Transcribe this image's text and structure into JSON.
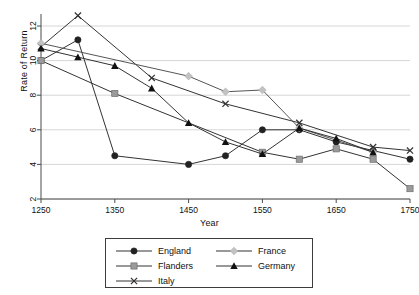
{
  "chart_data": {
    "type": "line",
    "title": "",
    "xlabel": "Year",
    "ylabel": "Rate of Return",
    "xlim": [
      1250,
      1750
    ],
    "ylim": [
      2,
      13
    ],
    "xticks": [
      1250,
      1350,
      1450,
      1550,
      1650,
      1750
    ],
    "yticks": [
      2,
      4,
      6,
      8,
      10,
      12
    ],
    "grid": "horizontal",
    "legend_position": "below-center",
    "series": [
      {
        "name": "England",
        "marker": "filled-circle",
        "color": "#222222",
        "x": [
          1250,
          1300,
          1350,
          1450,
          1500,
          1550,
          1600,
          1650,
          1700,
          1750
        ],
        "y": [
          10.0,
          11.2,
          4.5,
          4.0,
          4.5,
          6.0,
          6.0,
          5.3,
          4.8,
          4.3
        ]
      },
      {
        "name": "Flanders",
        "marker": "filled-square",
        "color": "#9a9a9a",
        "x": [
          1250,
          1350,
          1550,
          1600,
          1650,
          1700,
          1750
        ],
        "y": [
          10.0,
          8.1,
          4.7,
          4.3,
          4.9,
          4.3,
          2.6
        ]
      },
      {
        "name": "Italy",
        "marker": "cross",
        "color": "#333333",
        "x": [
          1250,
          1300,
          1400,
          1500,
          1600,
          1700,
          1750
        ],
        "y": [
          10.8,
          12.6,
          9.0,
          7.5,
          6.4,
          5.0,
          4.8
        ]
      },
      {
        "name": "France",
        "marker": "filled-diamond",
        "color": "#c2c2c2",
        "x": [
          1250,
          1450,
          1500,
          1550,
          1600,
          1700
        ],
        "y": [
          11.0,
          9.1,
          8.2,
          8.3,
          6.1,
          4.7
        ]
      },
      {
        "name": "Germany",
        "marker": "filled-triangle",
        "color": "#111111",
        "x": [
          1250,
          1300,
          1350,
          1400,
          1450,
          1500,
          1550,
          1600,
          1650,
          1700
        ],
        "y": [
          10.7,
          10.2,
          9.7,
          8.4,
          6.4,
          5.3,
          4.6,
          6.1,
          5.5,
          4.7
        ]
      }
    ]
  },
  "axes": {
    "y_title": "Rate of Return",
    "x_title": "Year",
    "x_tick_labels": [
      "1250",
      "1350",
      "1450",
      "1550",
      "1650",
      "1750"
    ],
    "y_tick_labels": [
      "2",
      "4",
      "6",
      "8",
      "10",
      "12"
    ]
  },
  "legend": {
    "entries": [
      {
        "label": "England",
        "marker": "filled-circle",
        "color": "#222222"
      },
      {
        "label": "France",
        "marker": "filled-diamond",
        "color": "#c2c2c2"
      },
      {
        "label": "Flanders",
        "marker": "filled-square",
        "color": "#9a9a9a"
      },
      {
        "label": "Germany",
        "marker": "filled-triangle",
        "color": "#111111"
      },
      {
        "label": "Italy",
        "marker": "cross",
        "color": "#333333"
      }
    ]
  },
  "colors": {
    "grid": "#d6d6d6",
    "axis": "#4a4a4a",
    "background": "#ffffff"
  }
}
